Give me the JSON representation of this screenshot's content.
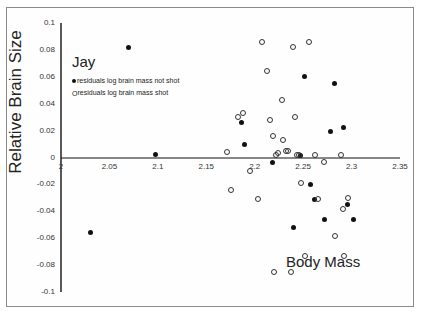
{
  "chart_data": {
    "type": "scatter",
    "title": "Jay",
    "xlabel": "Body Mass",
    "ylabel": "Relative Brain Size",
    "xlim": [
      2,
      2.35
    ],
    "ylim": [
      -0.1,
      0.1
    ],
    "xticks": [
      "2",
      "2.05",
      "2.1",
      "2.15",
      "2.2",
      "2.25",
      "2.3",
      "2.35"
    ],
    "yticks": [
      "0.1",
      "0.08",
      "0.06",
      "0.04",
      "0.02",
      "0",
      "-0.02",
      "-0.04",
      "-0.06",
      "-0.08",
      "-0.1"
    ],
    "grid": false,
    "legend_position": "upper-left",
    "legend": [
      {
        "marker": "filled-circle",
        "label": "residuals log brain mass not shot"
      },
      {
        "marker": "open-circle",
        "label": "residuals log brain mass shot"
      }
    ],
    "series": [
      {
        "name": "residuals log brain mass not shot",
        "marker": "filled-circle",
        "points": [
          [
            2.07,
            0.082
          ],
          [
            2.098,
            0.002
          ],
          [
            2.186,
            0.026
          ],
          [
            2.189,
            0.01
          ],
          [
            2.218,
            -0.004
          ],
          [
            2.247,
            0.0015
          ],
          [
            2.251,
            0.06
          ],
          [
            2.258,
            -0.02
          ],
          [
            2.262,
            -0.031
          ],
          [
            2.272,
            -0.046
          ],
          [
            2.278,
            0.019
          ],
          [
            2.282,
            0.055
          ],
          [
            2.292,
            0.022
          ],
          [
            2.296,
            -0.035
          ],
          [
            2.302,
            -0.046
          ],
          [
            2.03,
            -0.056
          ],
          [
            2.24,
            -0.052
          ]
        ]
      },
      {
        "name": "residuals log brain mass shot",
        "marker": "open-circle",
        "points": [
          [
            2.171,
            0.004
          ],
          [
            2.175,
            -0.024
          ],
          [
            2.183,
            0.03
          ],
          [
            2.188,
            0.033
          ],
          [
            2.195,
            -0.01
          ],
          [
            2.203,
            -0.031
          ],
          [
            2.208,
            0.086
          ],
          [
            2.213,
            0.064
          ],
          [
            2.216,
            0.028
          ],
          [
            2.219,
            0.016
          ],
          [
            2.22,
            -0.085
          ],
          [
            2.222,
            0.002
          ],
          [
            2.224,
            0.003
          ],
          [
            2.228,
            0.043
          ],
          [
            2.229,
            0.013
          ],
          [
            2.232,
            0.0045
          ],
          [
            2.234,
            0.0045
          ],
          [
            2.237,
            -0.085
          ],
          [
            2.24,
            0.082
          ],
          [
            2.242,
            0.03
          ],
          [
            2.244,
            0.0015
          ],
          [
            2.246,
            0.0015
          ],
          [
            2.248,
            -0.019
          ],
          [
            2.252,
            -0.073
          ],
          [
            2.256,
            0.086
          ],
          [
            2.262,
            0.0015
          ],
          [
            2.265,
            -0.031
          ],
          [
            2.272,
            -0.003
          ],
          [
            2.283,
            -0.058
          ],
          [
            2.289,
            0.0015
          ],
          [
            2.291,
            -0.038
          ],
          [
            2.292,
            -0.073
          ],
          [
            2.296,
            -0.03
          ]
        ]
      }
    ]
  }
}
